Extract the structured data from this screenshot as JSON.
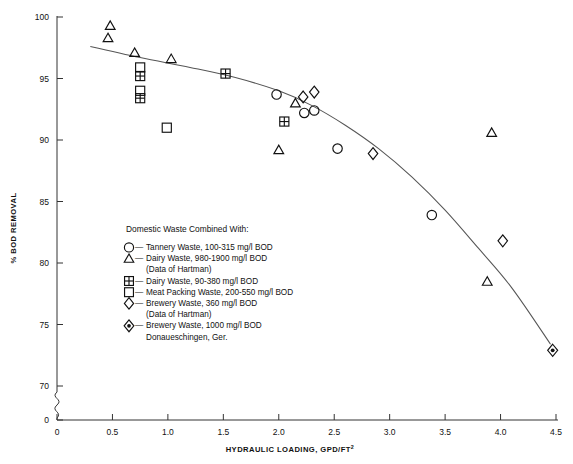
{
  "chart_data": {
    "type": "scatter",
    "title": "",
    "xlabel": "HYDRAULIC LOADING, GPD/FT",
    "xlabel_sup": "2",
    "ylabel": "% BOD REMOVAL",
    "xlim": [
      0,
      4.5
    ],
    "ylim": [
      70,
      100
    ],
    "y_axis_break": true,
    "y_break_label": "0",
    "grid": false,
    "xticks": [
      "0",
      "0.5",
      "1.0",
      "1.5",
      "2.0",
      "2.5",
      "3.0",
      "3.5",
      "4.0",
      "4.5"
    ],
    "xtick_values": [
      0,
      0.5,
      1.0,
      1.5,
      2.0,
      2.5,
      3.0,
      3.5,
      4.0,
      4.5
    ],
    "yticks": [
      "100",
      "95",
      "90",
      "85",
      "80",
      "75",
      "70"
    ],
    "ytick_values": [
      100,
      95,
      90,
      85,
      80,
      75,
      70
    ],
    "legend_position": "inside-left",
    "legend_title": "Domestic Waste Combined With:",
    "legend": [
      {
        "symbol": "circle",
        "label": "Tannery Waste, 100-315 mg/l BOD"
      },
      {
        "symbol": "triangle",
        "label": "Dairy Waste, 980-1900 mg/l BOD"
      },
      {
        "symbol": "none",
        "label": "(Data of Hartman)"
      },
      {
        "symbol": "crossed-square",
        "label": "Dairy Waste, 90-380 mg/l BOD"
      },
      {
        "symbol": "square",
        "label": "Meat Packing Waste, 200-550 mg/l BOD"
      },
      {
        "symbol": "diamond",
        "label": "Brewery Waste, 360 mg/l BOD"
      },
      {
        "symbol": "none",
        "label": "(Data of Hartman)"
      },
      {
        "symbol": "dotted-diamond",
        "label": "Brewery Waste, 1000 mg/l BOD"
      },
      {
        "symbol": "none",
        "label": "Donaueschingen, Ger."
      }
    ],
    "series": [
      {
        "name": "Tannery Waste, 100-315 mg/l BOD",
        "symbol": "circle",
        "points": [
          {
            "x": 1.98,
            "y": 93.7
          },
          {
            "x": 2.23,
            "y": 92.2
          },
          {
            "x": 2.32,
            "y": 92.4
          },
          {
            "x": 2.53,
            "y": 89.3
          },
          {
            "x": 3.38,
            "y": 83.9
          }
        ]
      },
      {
        "name": "Dairy Waste, 980-1900 mg/l BOD (Data of Hartman)",
        "symbol": "triangle",
        "points": [
          {
            "x": 0.48,
            "y": 99.3
          },
          {
            "x": 0.46,
            "y": 98.3
          },
          {
            "x": 0.7,
            "y": 97.1
          },
          {
            "x": 1.03,
            "y": 96.6
          },
          {
            "x": 2.15,
            "y": 93.0
          },
          {
            "x": 2.0,
            "y": 89.2
          },
          {
            "x": 3.92,
            "y": 90.6
          },
          {
            "x": 3.88,
            "y": 78.5
          }
        ]
      },
      {
        "name": "Dairy Waste, 90-380 mg/l BOD",
        "symbol": "crossed-square",
        "points": [
          {
            "x": 0.75,
            "y": 95.2
          },
          {
            "x": 0.75,
            "y": 93.4
          },
          {
            "x": 1.52,
            "y": 95.4
          },
          {
            "x": 2.05,
            "y": 91.5
          }
        ]
      },
      {
        "name": "Meat Packing Waste, 200-550 mg/l BOD",
        "symbol": "square",
        "points": [
          {
            "x": 0.75,
            "y": 95.9
          },
          {
            "x": 0.75,
            "y": 94.0
          },
          {
            "x": 0.99,
            "y": 91.0
          }
        ]
      },
      {
        "name": "Brewery Waste, 360 mg/l BOD (Data of Hartman)",
        "symbol": "diamond",
        "points": [
          {
            "x": 2.22,
            "y": 93.5
          },
          {
            "x": 2.32,
            "y": 93.9
          },
          {
            "x": 2.85,
            "y": 88.9
          },
          {
            "x": 4.02,
            "y": 81.8
          }
        ]
      },
      {
        "name": "Brewery Waste, 1000 mg/l BOD Donaueschingen, Ger.",
        "symbol": "dotted-diamond",
        "points": [
          {
            "x": 4.47,
            "y": 72.9
          }
        ]
      }
    ],
    "fit_curve": {
      "description": "smooth decreasing trend line",
      "points": [
        {
          "x": 0.3,
          "y": 97.6
        },
        {
          "x": 0.75,
          "y": 96.7
        },
        {
          "x": 1.2,
          "y": 95.9
        },
        {
          "x": 1.6,
          "y": 95.1
        },
        {
          "x": 2.0,
          "y": 94.0
        },
        {
          "x": 2.3,
          "y": 92.8
        },
        {
          "x": 2.6,
          "y": 91.2
        },
        {
          "x": 2.9,
          "y": 89.3
        },
        {
          "x": 3.2,
          "y": 87.0
        },
        {
          "x": 3.5,
          "y": 84.3
        },
        {
          "x": 3.8,
          "y": 81.2
        },
        {
          "x": 4.1,
          "y": 78.0
        },
        {
          "x": 4.45,
          "y": 73.4
        }
      ]
    }
  }
}
